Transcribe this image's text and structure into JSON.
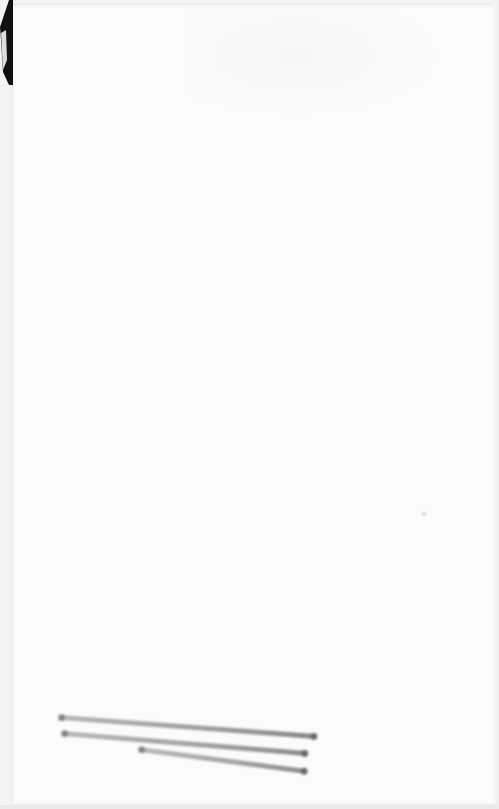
{
  "document": {
    "type": "scanned-page",
    "visible_text": [],
    "background_color": "#fbfbfb",
    "marks": [
      {
        "kind": "pencil-stroke",
        "x1": 60,
        "y1": 717,
        "x2": 315,
        "y2": 736,
        "color": "#6e6e6e"
      },
      {
        "kind": "pencil-stroke",
        "x1": 63,
        "y1": 733,
        "x2": 306,
        "y2": 753,
        "color": "#727272"
      },
      {
        "kind": "pencil-stroke",
        "x1": 140,
        "y1": 749,
        "x2": 306,
        "y2": 771,
        "color": "#767676"
      }
    ],
    "corner_fold": {
      "position": "top-left",
      "color": "#111111"
    }
  }
}
